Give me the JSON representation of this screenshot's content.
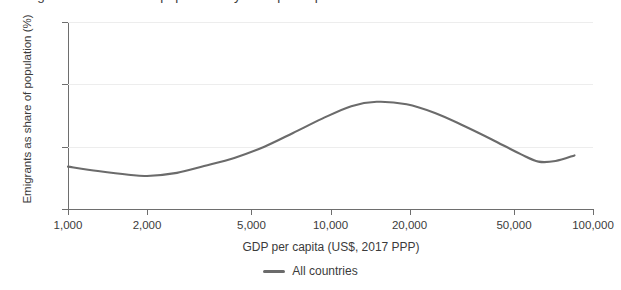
{
  "chart_data": {
    "type": "line",
    "title": "Emigrants as a share of population by GDP per capita",
    "xlabel": "GDP per capita (US$, 2017 PPP)",
    "ylabel": "Emigrants as share of population (%)",
    "x_scale": "log",
    "xlim": [
      1000,
      100000
    ],
    "ylim": [
      0,
      30
    ],
    "yticks": [
      0,
      10,
      20,
      30
    ],
    "ytick_labels": [
      "0",
      "10",
      "20",
      "30"
    ],
    "xticks": [
      1000,
      2000,
      5000,
      10000,
      20000,
      50000,
      100000
    ],
    "xtick_labels": [
      "1,000",
      "2,000",
      "5,000",
      "10,000",
      "20,000",
      "50,000",
      "100,000"
    ],
    "grid": true,
    "legend_position": "bottom",
    "line_color": "#6b6b6b",
    "grid_color": "#ededed",
    "axis_color": "#6e6e6e",
    "series": [
      {
        "name": "All countries",
        "x": [
          1000,
          1300,
          1700,
          2000,
          2600,
          3300,
          4300,
          5600,
          7200,
          9300,
          12000,
          15000,
          19500,
          25000,
          32000,
          41000,
          53000,
          62000,
          72000,
          85000
        ],
        "values": [
          6.8,
          6.1,
          5.5,
          5.3,
          5.8,
          6.9,
          8.2,
          10.0,
          12.2,
          14.5,
          16.5,
          17.2,
          16.8,
          15.4,
          13.4,
          11.2,
          8.8,
          7.6,
          7.7,
          8.6
        ]
      }
    ]
  },
  "legend": {
    "entries": [
      {
        "label": "All countries",
        "color": "#6b6b6b"
      }
    ]
  }
}
